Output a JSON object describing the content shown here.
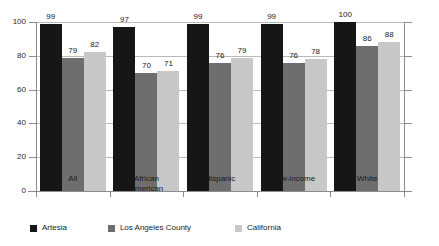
{
  "chart_data": {
    "type": "bar",
    "title": "",
    "subtitle": "",
    "xlabel": "",
    "ylabel": "",
    "ylim": [
      0,
      100
    ],
    "yticks": [
      0,
      20,
      40,
      60,
      80,
      100
    ],
    "ytick_labels": [
      "0",
      "20",
      "40",
      "60",
      "80",
      "100"
    ],
    "grid": true,
    "grid_axis": "y",
    "legend_position": "bottom-left",
    "orientation": "vertical",
    "grouped": true,
    "data_labels": true,
    "categories": [
      "All",
      "African American",
      "Hispanic",
      "Low-income",
      "White"
    ],
    "category_lines": [
      [
        "All"
      ],
      [
        "African",
        "American"
      ],
      [
        "Hispanic"
      ],
      [
        "Low-income"
      ],
      [
        "White"
      ]
    ],
    "series": [
      {
        "name": "Artesia",
        "color": "#161616",
        "values": [
          99,
          97,
          99,
          99,
          100
        ]
      },
      {
        "name": "Los Angeles County",
        "color": "#6e6e6e",
        "values": [
          79,
          70,
          76,
          76,
          86
        ]
      },
      {
        "name": "California",
        "color": "#c8c8c8",
        "values": [
          82,
          71,
          79,
          78,
          88
        ]
      }
    ]
  },
  "axis": {
    "line_color": "#8d8d8d",
    "grid_color": "#b9b9b9"
  },
  "legend": {
    "items": [
      {
        "label": "Artesia",
        "color": "#161616"
      },
      {
        "label": "Los Angeles County",
        "color": "#6e6e6e"
      },
      {
        "label": "California",
        "color": "#c8c8c8"
      }
    ]
  }
}
